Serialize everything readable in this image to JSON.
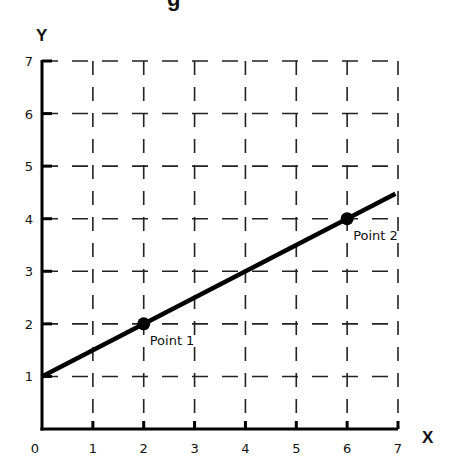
{
  "chart_data": {
    "type": "line",
    "title": "",
    "title_fragment": "g",
    "xlabel": "X",
    "ylabel": "Y",
    "xlim": [
      0,
      7
    ],
    "ylim": [
      0,
      7
    ],
    "x_ticks": [
      "0",
      "1",
      "2",
      "3",
      "4",
      "5",
      "6",
      "7"
    ],
    "y_ticks": [
      "1",
      "2",
      "3",
      "4",
      "5",
      "6",
      "7"
    ],
    "grid": "dashed",
    "series": [
      {
        "name": "line",
        "equation": "y = 0.5x + 1",
        "x": [
          0,
          6.95
        ],
        "y": [
          1,
          4.475
        ]
      }
    ],
    "points": [
      {
        "label": "Point 1",
        "x": 2,
        "y": 2
      },
      {
        "label": "Point 2",
        "x": 6,
        "y": 4
      }
    ],
    "colors": {
      "line": "#000000",
      "grid": "#222222",
      "background": "#ffffff"
    }
  }
}
